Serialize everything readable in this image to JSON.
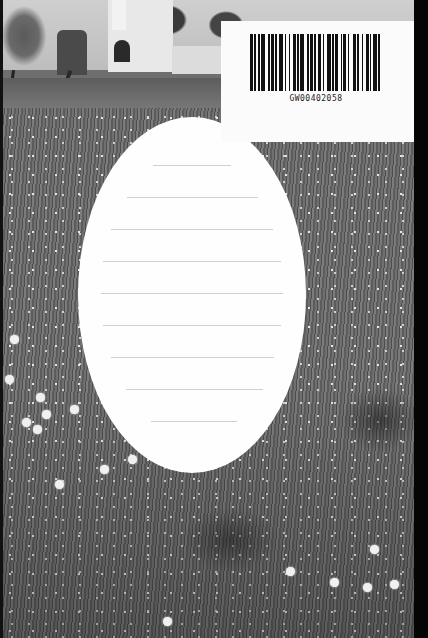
{
  "scene": {
    "description": "Scanned book cover: grayscale photograph of a wildflower meadow with a whitewashed building in the background",
    "colors": {
      "photo_mid_gray": "#6e6e6e",
      "label_white": "#fefefe",
      "rule_gray": "#cfcfcf",
      "barcode_black": "#111111",
      "scan_border": "#050505"
    }
  },
  "title_label": {
    "shape": "oval",
    "rule_count": 9,
    "text": ""
  },
  "barcode_sticker": {
    "code": "GW00402058",
    "pattern": [
      2,
      1,
      1,
      2,
      1,
      1,
      3,
      2,
      1,
      1,
      2,
      1,
      1,
      2,
      3,
      1,
      1,
      2,
      1,
      2,
      2,
      1,
      1,
      1,
      3,
      2,
      1,
      1,
      2,
      1,
      1,
      2,
      2,
      1,
      1,
      2,
      3,
      1,
      1,
      1,
      2,
      2,
      1,
      1,
      2,
      1,
      1,
      3,
      2,
      1,
      1,
      2,
      1,
      2,
      2,
      1,
      1,
      1,
      3,
      1,
      1,
      2
    ]
  }
}
